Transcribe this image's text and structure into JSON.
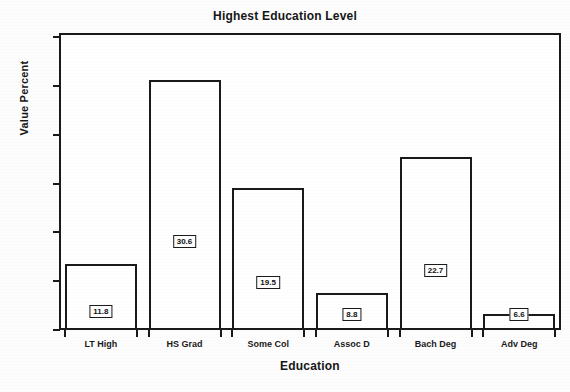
{
  "chart_data": {
    "type": "bar",
    "title": "Highest Education Level",
    "xlabel": "Education",
    "ylabel": "Value Percent",
    "categories": [
      "LT High",
      "HS Grad",
      "Some Col",
      "Assoc D",
      "Bach Deg",
      "Adv Deg"
    ],
    "values": [
      11.8,
      30.6,
      19.5,
      8.8,
      22.7,
      6.6
    ],
    "value_labels": [
      "11.8",
      "30.6",
      "19.5",
      "8.8",
      "22.7",
      "6.6"
    ],
    "ylim": [
      5.0,
      35.0
    ],
    "ytick_labels": [
      "5.0",
      "10.0",
      "15.0",
      "20.0",
      "25.0",
      "30.0",
      "35.0"
    ],
    "ytick_values": [
      5.0,
      10.0,
      15.0,
      20.0,
      25.0,
      30.0,
      35.0
    ],
    "grid": false,
    "legend": "none",
    "bar_fill_color": "#ffffff",
    "bar_border_color": "#1a1a1a",
    "text_color": "#161616"
  }
}
